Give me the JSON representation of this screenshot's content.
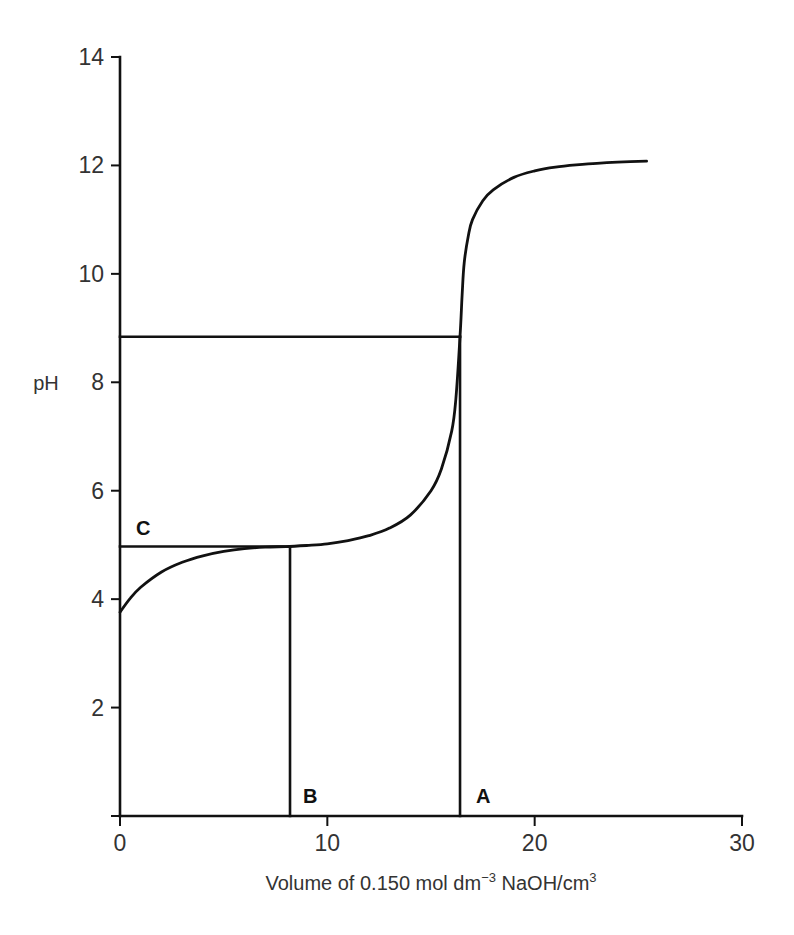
{
  "chart_data": {
    "type": "line",
    "title": "",
    "xlabel": "Volume of 0.150 mol dm⁻³ NaOH/cm³",
    "xlabel_parts": {
      "main": "Volume of 0.150 mol dm",
      "sup1": "−3",
      "mid": " NaOH/cm",
      "sup2": "3"
    },
    "ylabel": "pH",
    "xlim": [
      0,
      30
    ],
    "ylim": [
      0,
      14
    ],
    "x_ticks": [
      0,
      10,
      20,
      30
    ],
    "y_ticks": [
      2,
      4,
      6,
      8,
      10,
      12,
      14
    ],
    "grid": false,
    "legend": null,
    "series": [
      {
        "name": "titration curve",
        "x": [
          0,
          0.5,
          1,
          2,
          3,
          4,
          5,
          6,
          7,
          8,
          9,
          10,
          11,
          12,
          13,
          14,
          15,
          15.5,
          16,
          16.2,
          16.4,
          16.5,
          16.6,
          16.8,
          17,
          17.5,
          18,
          19,
          20,
          21,
          22,
          23,
          24,
          25.4
        ],
        "y": [
          3.76,
          4.02,
          4.22,
          4.5,
          4.68,
          4.8,
          4.88,
          4.93,
          4.96,
          4.97,
          4.99,
          5.02,
          5.08,
          5.17,
          5.31,
          5.55,
          6.0,
          6.4,
          7.1,
          7.7,
          8.84,
          9.6,
          10.2,
          10.7,
          11.0,
          11.35,
          11.55,
          11.78,
          11.9,
          11.97,
          12.01,
          12.04,
          12.06,
          12.08
        ]
      }
    ],
    "annotations": [
      {
        "label": "A",
        "type": "vertical-line",
        "x": 16.4,
        "from_y": 0,
        "to_y": 8.84,
        "description": "equivalence point volume"
      },
      {
        "label": "B",
        "type": "vertical-line",
        "x": 8.2,
        "from_y": 0,
        "to_y": 4.97,
        "description": "half-equivalence volume"
      },
      {
        "label": "C",
        "type": "horizontal-line",
        "y": 4.97,
        "from_x": 0,
        "to_x": 8.2,
        "description": "pH at half-equivalence (pKa)"
      },
      {
        "label": "",
        "type": "horizontal-line",
        "y": 8.84,
        "from_x": 0,
        "to_x": 16.4,
        "description": "pH at equivalence point"
      }
    ]
  },
  "labels": {
    "y_axis": "pH",
    "marker_a": "A",
    "marker_b": "B",
    "marker_c": "C"
  }
}
